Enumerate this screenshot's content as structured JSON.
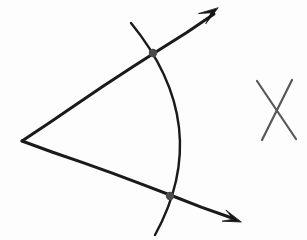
{
  "figure": {
    "type": "geometry-diagram",
    "width": 307,
    "height": 240,
    "background_color": "#fdfdfd",
    "ink_color": "#1a1a1a",
    "mark_color": "#58585a",
    "dot_color": "#4a4a4a"
  },
  "geometry": {
    "vertex": {
      "name": "angle-vertex",
      "x": 22,
      "y": 141
    },
    "rays": [
      {
        "name": "upper-ray",
        "from": {
          "x": 22,
          "y": 141
        },
        "to": {
          "x": 214,
          "y": 14
        },
        "arrow_tip": {
          "x": 218,
          "y": 8
        },
        "stroke_width": 3.0
      },
      {
        "name": "lower-ray",
        "from": {
          "x": 22,
          "y": 141
        },
        "to": {
          "x": 232,
          "y": 218
        },
        "arrow_tip": {
          "x": 241,
          "y": 222
        },
        "stroke_width": 3.0
      }
    ],
    "arc": {
      "name": "construction-arc",
      "start": {
        "x": 131,
        "y": 23
      },
      "control": {
        "x": 215,
        "y": 126
      },
      "end": {
        "x": 155,
        "y": 235
      },
      "bulge_direction": "right",
      "rightmost_x": 185,
      "stroke_width": 2.4
    },
    "intersection_points": [
      {
        "name": "upper-intersection",
        "x": 153,
        "y": 53,
        "radius": 4.2
      },
      {
        "name": "lower-intersection",
        "x": 170,
        "y": 196,
        "radius": 4.2
      }
    ],
    "x_mark": {
      "name": "x-mark",
      "stroke_width": 2.2,
      "color": "#58585a",
      "stroke_a": {
        "x1": 257,
        "y1": 81,
        "x2": 296,
        "y2": 139
      },
      "stroke_b": {
        "x1": 292,
        "y1": 80,
        "x2": 262,
        "y2": 140
      },
      "crossing": {
        "x": 277,
        "y": 108
      }
    }
  },
  "labels": []
}
